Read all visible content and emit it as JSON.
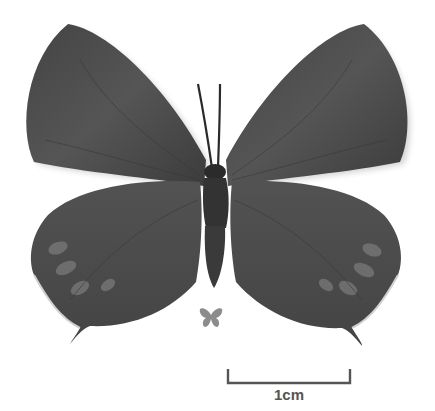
{
  "image": {
    "subject": "butterfly specimen, dorsal view",
    "background_color": "#ffffff",
    "wing_color": "#4a4a4a",
    "wing_highlight_color": "#8a8a8a",
    "body_color": "#2e2e2e"
  },
  "size_icon": {
    "name": "actual-size-butterfly-icon",
    "color": "#8c8c8c"
  },
  "scale_bar": {
    "label": "1cm",
    "color": "#555555"
  }
}
